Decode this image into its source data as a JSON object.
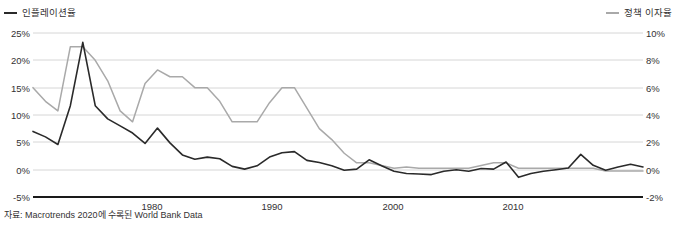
{
  "legend": {
    "left": {
      "label": "인플레이션율",
      "color": "#2a2a2a",
      "icon": "line-swatch-icon"
    },
    "right": {
      "label": "정책 이자율",
      "color": "#a9a9a9",
      "icon": "line-swatch-icon"
    }
  },
  "source_note": "자료: Macrotrends 2020에 수록된 World Bank Data",
  "axes": {
    "left_ticks": [
      "25%",
      "20%",
      "15%",
      "10%",
      "5%",
      "0%",
      "-5%"
    ],
    "right_ticks": [
      "10%",
      "8%",
      "6%",
      "4%",
      "2%",
      "0%",
      "-2%"
    ],
    "x_ticks": [
      "1980",
      "1990",
      "2000",
      "2010"
    ]
  },
  "chart_data": {
    "type": "line",
    "title": "",
    "subtitle": "",
    "xlabel": "",
    "ylabel": "",
    "grid": true,
    "legend_position": "top",
    "source": "자료: Macrotrends 2020에 수록된 World Bank Data",
    "x": [
      1970,
      1971,
      1972,
      1973,
      1974,
      1975,
      1976,
      1977,
      1978,
      1979,
      1980,
      1981,
      1982,
      1983,
      1984,
      1985,
      1986,
      1987,
      1988,
      1989,
      1990,
      1991,
      1992,
      1993,
      1994,
      1995,
      1996,
      1997,
      1998,
      1999,
      2000,
      2001,
      2002,
      2003,
      2004,
      2005,
      2006,
      2007,
      2008,
      2009,
      2010,
      2011,
      2012,
      2013,
      2014,
      2015,
      2016,
      2017,
      2018,
      2019
    ],
    "axes": {
      "left": {
        "label": "인플레이션율",
        "ticks": [
          25,
          20,
          15,
          10,
          5,
          0,
          -5
        ],
        "ylim": [
          -5,
          25
        ],
        "unit": "%"
      },
      "right": {
        "label": "정책 이자율",
        "ticks": [
          10,
          8,
          6,
          4,
          2,
          0,
          -2
        ],
        "ylim": [
          -2,
          10
        ],
        "unit": "%"
      },
      "xlim": [
        1970,
        2019
      ],
      "x_ticklabels": [
        "1980",
        "1990",
        "2000",
        "2010"
      ]
    },
    "series": [
      {
        "name": "인플레이션율",
        "axis": "left",
        "color": "#2a2a2a",
        "unit": "%",
        "values": [
          7.0,
          6.0,
          4.6,
          11.7,
          23.3,
          11.7,
          9.3,
          8.0,
          6.7,
          4.8,
          7.6,
          4.9,
          2.7,
          1.9,
          2.3,
          2.0,
          0.6,
          0.1,
          0.7,
          2.3,
          3.1,
          3.3,
          1.7,
          1.3,
          0.7,
          -0.1,
          0.1,
          1.8,
          0.7,
          -0.3,
          -0.7,
          -0.8,
          -0.9,
          -0.3,
          0.0,
          -0.3,
          0.2,
          0.1,
          1.4,
          -1.4,
          -0.7,
          -0.3,
          0.0,
          0.3,
          2.8,
          0.8,
          -0.1,
          0.5,
          1.0,
          0.5
        ]
      },
      {
        "name": "정책 이자율",
        "axis": "right",
        "color": "#a9a9a9",
        "unit": "%",
        "values": [
          6.0,
          5.0,
          4.3,
          9.0,
          9.0,
          8.0,
          6.5,
          4.3,
          3.5,
          6.3,
          7.3,
          6.8,
          6.8,
          6.0,
          6.0,
          5.0,
          3.5,
          3.5,
          3.5,
          4.9,
          6.0,
          6.0,
          4.5,
          3.0,
          2.2,
          1.2,
          0.5,
          0.5,
          0.3,
          0.1,
          0.2,
          0.1,
          0.1,
          0.1,
          0.1,
          0.1,
          0.3,
          0.5,
          0.5,
          0.1,
          0.1,
          0.1,
          0.1,
          0.1,
          0.1,
          0.1,
          -0.1,
          -0.1,
          -0.1,
          -0.1
        ]
      }
    ]
  },
  "geometry": {
    "plot": {
      "left": 33,
      "right": 643,
      "top": 33,
      "bottom": 197
    },
    "gridline_y": [
      33,
      60,
      88,
      115,
      142,
      170,
      197
    ],
    "x_tick_px": [
      152,
      272.5,
      393,
      513.5
    ]
  }
}
